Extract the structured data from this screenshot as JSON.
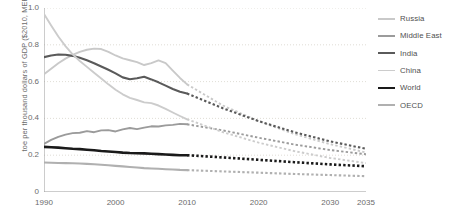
{
  "chart_data": {
    "type": "line",
    "title": "",
    "xlabel": "",
    "ylabel": "toe per thousand dollars of GDP ($2010, MER)",
    "xlim": [
      1990,
      2035
    ],
    "ylim": [
      0,
      1.0
    ],
    "yticks": [
      "0",
      "0.2",
      "0.4",
      "0.6",
      "0.8",
      "1.0"
    ],
    "ytick_values": [
      0,
      0.2,
      0.4,
      0.6,
      0.8,
      1.0
    ],
    "xticks": [
      "1990",
      "2000",
      "2010",
      "2020",
      "2030",
      "2035"
    ],
    "xtick_values": [
      1990,
      2000,
      2010,
      2020,
      2030,
      2035
    ],
    "grid": "horizontal-dotted",
    "legend_position": "right",
    "history_end": 2010,
    "projection_style": "dashed",
    "series": [
      {
        "name": "Russia",
        "color": "#c9c9c9",
        "width": 1.9,
        "x": [
          1990,
          1991,
          1992,
          1993,
          1994,
          1995,
          1996,
          1997,
          1998,
          1999,
          2000,
          2001,
          2002,
          2003,
          2004,
          2005,
          2006,
          2007,
          2008,
          2009,
          2010
        ],
        "values": [
          0.64,
          0.67,
          0.7,
          0.725,
          0.745,
          0.762,
          0.773,
          0.779,
          0.777,
          0.762,
          0.742,
          0.726,
          0.716,
          0.706,
          0.69,
          0.7,
          0.715,
          0.7,
          0.66,
          0.62,
          0.585
        ],
        "proj_x": [
          2010,
          2015,
          2020,
          2025,
          2030,
          2035
        ],
        "proj_values": [
          0.585,
          0.47,
          0.385,
          0.315,
          0.26,
          0.215
        ]
      },
      {
        "name": "Middle East",
        "color": "#9b9b9b",
        "width": 1.9,
        "x": [
          1990,
          1991,
          1992,
          1993,
          1994,
          1995,
          1996,
          1997,
          1998,
          1999,
          2000,
          2001,
          2002,
          2003,
          2004,
          2005,
          2006,
          2007,
          2008,
          2009,
          2010
        ],
        "values": [
          0.262,
          0.283,
          0.3,
          0.312,
          0.32,
          0.322,
          0.331,
          0.325,
          0.335,
          0.336,
          0.329,
          0.34,
          0.348,
          0.342,
          0.35,
          0.357,
          0.356,
          0.362,
          0.365,
          0.37,
          0.368
        ],
        "proj_x": [
          2010,
          2015,
          2020,
          2025,
          2030,
          2035
        ],
        "proj_values": [
          0.368,
          0.335,
          0.295,
          0.258,
          0.228,
          0.205
        ]
      },
      {
        "name": "India",
        "color": "#5a5a5a",
        "width": 2.1,
        "x": [
          1990,
          1991,
          1992,
          1993,
          1994,
          1995,
          1996,
          1997,
          1998,
          1999,
          2000,
          2001,
          2002,
          2003,
          2004,
          2005,
          2006,
          2007,
          2008,
          2009,
          2010
        ],
        "values": [
          0.733,
          0.742,
          0.747,
          0.746,
          0.74,
          0.73,
          0.716,
          0.7,
          0.682,
          0.664,
          0.645,
          0.623,
          0.613,
          0.618,
          0.626,
          0.612,
          0.596,
          0.578,
          0.56,
          0.545,
          0.535
        ],
        "proj_x": [
          2010,
          2015,
          2020,
          2025,
          2030,
          2035
        ],
        "proj_values": [
          0.535,
          0.455,
          0.385,
          0.325,
          0.275,
          0.235
        ]
      },
      {
        "name": "China",
        "color": "#cccccc",
        "width": 1.9,
        "x": [
          1990,
          1991,
          1992,
          1993,
          1994,
          1995,
          1996,
          1997,
          1998,
          1999,
          2000,
          2001,
          2002,
          2003,
          2004,
          2005,
          2006,
          2007,
          2008,
          2009,
          2010
        ],
        "values": [
          0.968,
          0.905,
          0.845,
          0.793,
          0.748,
          0.712,
          0.68,
          0.648,
          0.617,
          0.585,
          0.556,
          0.531,
          0.512,
          0.5,
          0.487,
          0.483,
          0.47,
          0.452,
          0.432,
          0.413,
          0.395
        ],
        "proj_x": [
          2010,
          2015,
          2020,
          2025,
          2030,
          2035
        ],
        "proj_values": [
          0.395,
          0.325,
          0.268,
          0.222,
          0.185,
          0.157
        ]
      },
      {
        "name": "World",
        "color": "#1a1a1a",
        "width": 2.6,
        "x": [
          1990,
          1991,
          1992,
          1993,
          1994,
          1995,
          1996,
          1997,
          1998,
          1999,
          2000,
          2001,
          2002,
          2003,
          2004,
          2005,
          2006,
          2007,
          2008,
          2009,
          2010
        ],
        "values": [
          0.245,
          0.243,
          0.241,
          0.238,
          0.235,
          0.233,
          0.23,
          0.227,
          0.223,
          0.22,
          0.217,
          0.214,
          0.212,
          0.211,
          0.21,
          0.208,
          0.206,
          0.204,
          0.202,
          0.2,
          0.2
        ],
        "proj_x": [
          2010,
          2015,
          2020,
          2025,
          2030,
          2035
        ],
        "proj_values": [
          0.2,
          0.188,
          0.175,
          0.162,
          0.15,
          0.14
        ]
      },
      {
        "name": "OECD",
        "color": "#b0b0b0",
        "width": 2.1,
        "x": [
          1990,
          1991,
          1992,
          1993,
          1994,
          1995,
          1996,
          1997,
          1998,
          1999,
          2000,
          2001,
          2002,
          2003,
          2004,
          2005,
          2006,
          2007,
          2008,
          2009,
          2010
        ],
        "values": [
          0.16,
          0.159,
          0.158,
          0.157,
          0.156,
          0.155,
          0.153,
          0.151,
          0.148,
          0.145,
          0.142,
          0.139,
          0.136,
          0.133,
          0.13,
          0.128,
          0.126,
          0.124,
          0.122,
          0.12,
          0.119
        ],
        "proj_x": [
          2010,
          2015,
          2020,
          2025,
          2030,
          2035
        ],
        "proj_values": [
          0.119,
          0.112,
          0.105,
          0.098,
          0.092,
          0.086
        ]
      }
    ]
  },
  "legend": {
    "items": [
      {
        "label": "Russia"
      },
      {
        "label": "Middle East"
      },
      {
        "label": "India"
      },
      {
        "label": "China"
      },
      {
        "label": "World"
      },
      {
        "label": "OECD"
      }
    ]
  }
}
